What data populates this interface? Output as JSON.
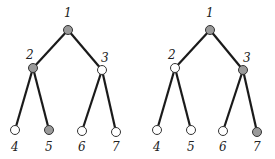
{
  "diagram": {
    "type": "binary-tree-pair",
    "colors": {
      "filled": "#9a9a9a",
      "empty": "#ffffff",
      "edge": "#1a1a1a"
    },
    "trees": [
      {
        "name": "left-tree",
        "offset_x": 0,
        "nodes": [
          {
            "id": "1",
            "x": 68,
            "y": 30,
            "filled": true,
            "lx": 64,
            "ly": 17
          },
          {
            "id": "2",
            "x": 33,
            "y": 68,
            "filled": true,
            "lx": 26,
            "ly": 59
          },
          {
            "id": "3",
            "x": 102,
            "y": 70,
            "filled": false,
            "lx": 101,
            "ly": 62
          },
          {
            "id": "4",
            "x": 15,
            "y": 130,
            "filled": false,
            "lx": 11,
            "ly": 151
          },
          {
            "id": "5",
            "x": 49,
            "y": 130,
            "filled": true,
            "lx": 45,
            "ly": 151
          },
          {
            "id": "6",
            "x": 82,
            "y": 131,
            "filled": false,
            "lx": 78,
            "ly": 151
          },
          {
            "id": "7",
            "x": 116,
            "y": 132,
            "filled": false,
            "lx": 112,
            "ly": 151
          }
        ],
        "edges": [
          [
            "1",
            "2"
          ],
          [
            "1",
            "3"
          ],
          [
            "2",
            "4"
          ],
          [
            "2",
            "5"
          ],
          [
            "3",
            "6"
          ],
          [
            "3",
            "7"
          ]
        ]
      },
      {
        "name": "right-tree",
        "offset_x": 0,
        "nodes": [
          {
            "id": "1",
            "x": 210,
            "y": 30,
            "filled": true,
            "lx": 206,
            "ly": 17
          },
          {
            "id": "2",
            "x": 175,
            "y": 68,
            "filled": false,
            "lx": 168,
            "ly": 59
          },
          {
            "id": "3",
            "x": 243,
            "y": 70,
            "filled": true,
            "lx": 243,
            "ly": 62
          },
          {
            "id": "4",
            "x": 157,
            "y": 130,
            "filled": false,
            "lx": 153,
            "ly": 151
          },
          {
            "id": "5",
            "x": 191,
            "y": 130,
            "filled": false,
            "lx": 187,
            "ly": 151
          },
          {
            "id": "6",
            "x": 223,
            "y": 131,
            "filled": false,
            "lx": 219,
            "ly": 151
          },
          {
            "id": "7",
            "x": 257,
            "y": 132,
            "filled": true,
            "lx": 253,
            "ly": 151
          }
        ],
        "edges": [
          [
            "1",
            "2"
          ],
          [
            "1",
            "3"
          ],
          [
            "2",
            "4"
          ],
          [
            "2",
            "5"
          ],
          [
            "3",
            "6"
          ],
          [
            "3",
            "7"
          ]
        ]
      }
    ]
  }
}
